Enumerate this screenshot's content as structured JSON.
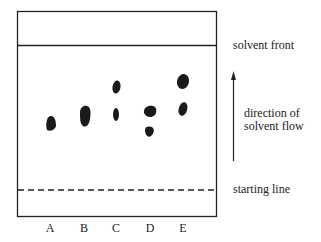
{
  "diagram": {
    "labels": {
      "solvent_front": "solvent front",
      "direction_line1": "direction of",
      "direction_line2": "solvent flow",
      "starting_line": "starting line"
    },
    "lanes": [
      {
        "id": "A",
        "spots": [
          {
            "shape": "blob-tilted"
          }
        ]
      },
      {
        "id": "B",
        "spots": [
          {
            "shape": "blob-tall"
          }
        ]
      },
      {
        "id": "C",
        "spots": [
          {
            "shape": "oval"
          },
          {
            "shape": "oval-small"
          }
        ]
      },
      {
        "id": "D",
        "spots": [
          {
            "shape": "blob-wide"
          },
          {
            "shape": "blob-small"
          }
        ]
      },
      {
        "id": "E",
        "spots": [
          {
            "shape": "oval-large"
          },
          {
            "shape": "oval"
          }
        ]
      }
    ],
    "colors": {
      "ink": "#1a1a1a"
    }
  }
}
